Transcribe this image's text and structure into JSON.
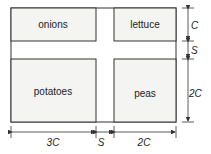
{
  "plots": [
    {
      "label": "onions"
    },
    {
      "label": "lettuce"
    },
    {
      "label": "potatoes"
    },
    {
      "label": "peas"
    }
  ],
  "dimensions": {
    "right": [
      "C",
      "S",
      "2C"
    ],
    "bottom": [
      "3C",
      "S",
      "2C"
    ]
  },
  "colors": {
    "plot_fill": "#f4f4f2",
    "line": "#333333"
  }
}
